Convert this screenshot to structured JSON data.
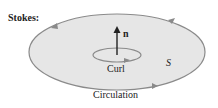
{
  "diagram": {
    "title": "Stokes:",
    "normal_label": "n",
    "curl_label": "Curl",
    "surface_label": "S",
    "circulation_label": "Circulation",
    "colors": {
      "surface_fill": "#e6e6e6",
      "boundary_stroke": "#8a8a8a",
      "arrow": "#222222"
    }
  }
}
